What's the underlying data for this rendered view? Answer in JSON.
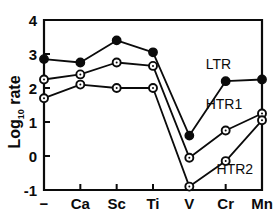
{
  "chart_data": {
    "type": "line",
    "title": "",
    "subtitle": "",
    "xlabel": "",
    "ylabel": "Log",
    "ylabel_sub": "10",
    "ylabel_tail": " rate",
    "ylabel_full": "Log10 rate",
    "categories": [
      "−",
      "Ca",
      "Sc",
      "Ti",
      "V",
      "Cr",
      "Mn"
    ],
    "x_tick_labels": [
      "−",
      "Ca",
      "Sc",
      "Ti",
      "V",
      "Cr",
      "Mn"
    ],
    "y_tick_labels": [
      "4",
      "3",
      "2",
      "1",
      "0",
      "-1"
    ],
    "y_tick_values": [
      4,
      3,
      2,
      1,
      0,
      -1
    ],
    "ylim": [
      -1,
      4
    ],
    "xlim": [
      0,
      6
    ],
    "grid": false,
    "legend_position": "inline-annotations",
    "series": [
      {
        "name": "LTR",
        "label": "LTR",
        "marker": "filled-circle",
        "color": "#0b0b0b",
        "annotation": "LTR",
        "values": [
          2.85,
          2.75,
          3.4,
          3.05,
          0.6,
          2.2,
          2.25
        ]
      },
      {
        "name": "HTR1",
        "label": "HTR1",
        "marker": "open-circle",
        "color": "#0b0b0b",
        "annotation": "HTR1",
        "values": [
          2.25,
          2.4,
          2.75,
          2.65,
          -0.05,
          0.75,
          1.25
        ]
      },
      {
        "name": "HTR2",
        "label": "HTR2",
        "marker": "open-circle",
        "color": "#0b0b0b",
        "annotation": "HTR2",
        "values": [
          1.7,
          2.1,
          2.0,
          2.0,
          -0.9,
          -0.15,
          1.05
        ]
      }
    ],
    "annotations": [
      {
        "text": "LTR",
        "x": 4.45,
        "y": 2.55
      },
      {
        "text": "HTR1",
        "x": 4.45,
        "y": 1.38
      },
      {
        "text": "HTR2",
        "x": 4.75,
        "y": -0.52
      }
    ],
    "axis_color": "#0b0b0b",
    "background_color": "#ffffff"
  }
}
